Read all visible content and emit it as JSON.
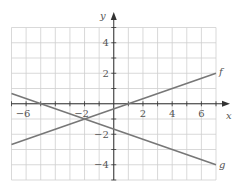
{
  "chart_data": {
    "type": "line",
    "title": "",
    "xlabel": "x",
    "ylabel": "y",
    "xlim": [
      -7,
      7
    ],
    "ylim": [
      -5,
      5
    ],
    "grid": true,
    "x_ticks": [
      -6,
      -2,
      2,
      4,
      6
    ],
    "x_tick_labels": [
      "−6",
      "−2",
      "2",
      "4",
      "6"
    ],
    "y_ticks": [
      4,
      2,
      -2,
      -4
    ],
    "y_tick_labels": [
      "4",
      "2",
      "−2",
      "−4"
    ],
    "series": [
      {
        "name": "f",
        "x": [
          -7,
          7
        ],
        "y": [
          -2.667,
          2
        ],
        "equation": "f(x) = x/3 − 1/3",
        "color": "#777777"
      },
      {
        "name": "g",
        "x": [
          -7,
          7
        ],
        "y": [
          0.667,
          -4
        ],
        "equation": "g(x) = −x/3 − 5/3",
        "color": "#777777"
      }
    ],
    "intersection": {
      "x": -2,
      "y": -1
    }
  },
  "labels": {
    "x_axis": "x",
    "y_axis": "y",
    "f": "f",
    "g": "g"
  }
}
